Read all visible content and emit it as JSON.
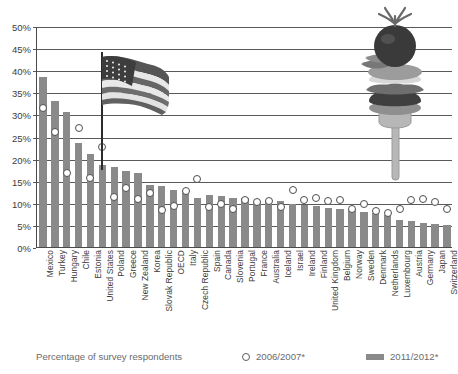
{
  "chart_data": {
    "type": "bar",
    "title": "",
    "xlabel": "",
    "ylabel": "Percentage of survey respondents",
    "ylim": [
      0,
      50
    ],
    "ytick_labels": [
      "0%",
      "5%",
      "10%",
      "15%",
      "20%",
      "25%",
      "30%",
      "35%",
      "40%",
      "45%",
      "50%"
    ],
    "ytick_values": [
      0,
      5,
      10,
      15,
      20,
      25,
      30,
      35,
      40,
      45,
      50
    ],
    "grid": true,
    "legend_position": "bottom",
    "categories": [
      "Mexico",
      "Turkey",
      "Hungary",
      "Chile",
      "Estonia",
      "United States",
      "Poland",
      "Greece",
      "New Zealand",
      "Korea",
      "Slovak Republic",
      "OECD",
      "Italy",
      "Czech Republic",
      "Spain",
      "Canada",
      "Slovenia",
      "Portugal",
      "France",
      "Australia",
      "Iceland",
      "Israel",
      "Ireland",
      "Finland",
      "United Kingdom",
      "Belgium",
      "Norway",
      "Sweden",
      "Denmark",
      "Netherlands",
      "Luxembourg",
      "Austria",
      "Germany",
      "Japan",
      "Switzerland"
    ],
    "series": [
      {
        "name": "2011/2012*",
        "marker": "bar",
        "color": "#8a8a8a",
        "values": [
          38.5,
          33.0,
          30.5,
          23.5,
          21.0,
          18.5,
          18.0,
          17.2,
          16.8,
          14.0,
          13.8,
          13.0,
          12.7,
          11.0,
          11.8,
          11.6,
          11.2,
          11.0,
          10.0,
          10.5,
          10.4,
          9.8,
          9.4,
          9.2,
          8.9,
          8.6,
          8.4,
          8.0,
          7.8,
          7.2,
          6.0,
          5.8,
          5.5,
          5.3,
          5.0
        ]
      },
      {
        "name": "2006/2007*",
        "marker": "circle",
        "color": "#ffffff",
        "values": [
          32.3,
          26.9,
          17.7,
          27.8,
          16.5,
          23.6,
          12.2,
          14.3,
          11.8,
          13.2,
          9.2,
          10.2,
          13.6,
          16.2,
          9.9,
          10.7,
          9.4,
          11.6,
          11.2,
          11.4,
          9.9,
          13.8,
          11.6,
          12.0,
          11.3,
          11.6,
          9.4,
          10.6,
          9.0,
          8.6,
          9.5,
          11.6,
          11.8,
          11.0,
          9.6
        ]
      }
    ]
  },
  "legend": {
    "caption": "Percentage of survey respondents",
    "items": [
      {
        "label": "2006/2007*",
        "marker": "circle"
      },
      {
        "label": "2011/2012*",
        "marker": "swatch"
      }
    ]
  },
  "decorations": [
    {
      "name": "us-flag",
      "at_category": "United States"
    },
    {
      "name": "food-on-fork",
      "description": "burger and vegetables stacked on a fork"
    }
  ]
}
